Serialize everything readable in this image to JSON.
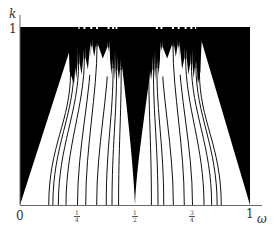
{
  "chart_data": {
    "type": "heatmap",
    "title": "",
    "xlabel": "ω",
    "ylabel": "k",
    "xlim": [
      0,
      1
    ],
    "ylim": [
      0,
      1
    ],
    "grid": false,
    "x_tick_labels": [
      "0",
      "1/4",
      "1/2",
      "3/4",
      "1"
    ],
    "x_ticks": [
      0,
      0.25,
      0.5,
      0.75,
      1
    ],
    "y_tick_labels": [
      "1"
    ],
    "y_ticks": [
      1
    ],
    "outer_tongues": [
      {
        "omega": 0,
        "apex_omega": 0.25,
        "apex_k": 1.0
      },
      {
        "omega": 1,
        "apex_omega": 0.77,
        "apex_k": 1.0
      }
    ],
    "half_tongue": {
      "omega": 0.5,
      "width_at_top": [
        0.45,
        0.57
      ],
      "top_k": 0.88
    },
    "tongue_lines": [
      {
        "omega": 0.125,
        "top_omega": 0.22,
        "top_k": 0.75
      },
      {
        "omega": 0.1429,
        "top_omega": 0.235,
        "top_k": 0.78
      },
      {
        "omega": 0.1667,
        "top_omega": 0.255,
        "top_k": 0.8
      },
      {
        "omega": 0.2,
        "top_omega": 0.28,
        "top_k": 0.83
      },
      {
        "omega": 0.25,
        "top_omega": 0.31,
        "top_k": 0.9
      },
      {
        "omega": 0.2857,
        "top_omega": 0.335,
        "top_k": 0.9
      },
      {
        "omega": 0.3333,
        "top_omega": 0.385,
        "top_k": 0.89
      },
      {
        "omega": 0.375,
        "top_omega": 0.405,
        "top_k": 0.78
      },
      {
        "omega": 0.4,
        "top_omega": 0.42,
        "top_k": 0.77
      },
      {
        "omega": 0.4286,
        "top_omega": 0.44,
        "top_k": 0.77
      },
      {
        "omega": 0.5,
        "top_omega": 0.5,
        "top_k": 0.0
      },
      {
        "omega": 0.5714,
        "top_omega": 0.56,
        "top_k": 0.77
      },
      {
        "omega": 0.6,
        "top_omega": 0.58,
        "top_k": 0.77
      },
      {
        "omega": 0.625,
        "top_omega": 0.595,
        "top_k": 0.78
      },
      {
        "omega": 0.6667,
        "top_omega": 0.615,
        "top_k": 0.89
      },
      {
        "omega": 0.7143,
        "top_omega": 0.665,
        "top_k": 0.9
      },
      {
        "omega": 0.75,
        "top_omega": 0.69,
        "top_k": 0.9
      },
      {
        "omega": 0.8,
        "top_omega": 0.72,
        "top_k": 0.83
      },
      {
        "omega": 0.8333,
        "top_omega": 0.745,
        "top_k": 0.8
      },
      {
        "omega": 0.8571,
        "top_omega": 0.765,
        "top_k": 0.78
      },
      {
        "omega": 0.875,
        "top_omega": 0.78,
        "top_k": 0.75
      }
    ],
    "colors": {
      "overlap_region": "#000000",
      "tongue": "#ffffff",
      "axis": "#666666"
    }
  },
  "labels": {
    "y_axis": "k",
    "y_one": "1",
    "x_zero": "0",
    "x_one": "1",
    "x_axis": "ω",
    "quarter_num": "1",
    "quarter_den": "4",
    "half_num": "1",
    "half_den": "2",
    "threeq_num": "3",
    "threeq_den": "4"
  }
}
